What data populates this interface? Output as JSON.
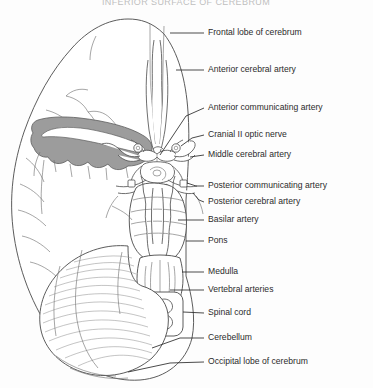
{
  "figure": {
    "title_partial": "INFERIOR SURFACE OF CEREBRUM",
    "view": "Inferior (ventral) view of the brain showing the cerebral arterial circle",
    "background_color": "#fdfdfd",
    "line_color": "#4a4a4a",
    "text_color": "#2b2b2b",
    "shaded_region_color": "#9c9c9c"
  },
  "labels": [
    {
      "id": "frontal-lobe",
      "text": "Frontal lobe of cerebrum",
      "text_x": 208,
      "text_y": 33,
      "leader_x1": 170,
      "leader_y1": 33,
      "leader_x2": 204,
      "leader_y2": 33
    },
    {
      "id": "anterior-cerebral-artery",
      "text": "Anterior cerebral artery",
      "text_x": 208,
      "text_y": 70,
      "leader_x1": 176,
      "leader_y1": 70,
      "leader_x2": 204,
      "leader_y2": 70
    },
    {
      "id": "anterior-communicating",
      "text": "Anterior communicating artery",
      "text_x": 208,
      "text_y": 108,
      "leader_x1": 160,
      "leader_y1": 155,
      "leader_x2": 204,
      "leader_y2": 108
    },
    {
      "id": "cranial-ii-optic-nerve",
      "text": "Cranial II optic nerve",
      "text_x": 208,
      "text_y": 135,
      "leader_x1": 176,
      "leader_y1": 150,
      "leader_x2": 204,
      "leader_y2": 135
    },
    {
      "id": "middle-cerebral-artery",
      "text": "Middle cerebral artery",
      "text_x": 208,
      "text_y": 155,
      "leader_x1": 186,
      "leader_y1": 158,
      "leader_x2": 204,
      "leader_y2": 155
    },
    {
      "id": "posterior-communicating",
      "text": "Posterior communicating artery",
      "text_x": 208,
      "text_y": 186,
      "leader_x1": 178,
      "leader_y1": 178,
      "leader_x2": 204,
      "leader_y2": 186
    },
    {
      "id": "posterior-cerebral-artery",
      "text": "Posterior cerebral artery",
      "text_x": 208,
      "text_y": 202,
      "leader_x1": 176,
      "leader_y1": 196,
      "leader_x2": 204,
      "leader_y2": 202
    },
    {
      "id": "basilar-artery",
      "text": "Basilar artery",
      "text_x": 208,
      "text_y": 220,
      "leader_x1": 168,
      "leader_y1": 220,
      "leader_x2": 204,
      "leader_y2": 220
    },
    {
      "id": "pons",
      "text": "Pons",
      "text_x": 208,
      "text_y": 241,
      "leader_x1": 168,
      "leader_y1": 241,
      "leader_x2": 204,
      "leader_y2": 241
    },
    {
      "id": "medulla",
      "text": "Medulla",
      "text_x": 208,
      "text_y": 272,
      "leader_x1": 172,
      "leader_y1": 272,
      "leader_x2": 204,
      "leader_y2": 272
    },
    {
      "id": "vertebral-arteries",
      "text": "Vertebral arteries",
      "text_x": 208,
      "text_y": 290,
      "leader_x1": 158,
      "leader_y1": 290,
      "leader_x2": 204,
      "leader_y2": 290
    },
    {
      "id": "spinal-cord",
      "text": "Spinal cord",
      "text_x": 208,
      "text_y": 313,
      "leader_x1": 156,
      "leader_y1": 305,
      "leader_x2": 204,
      "leader_y2": 313
    },
    {
      "id": "cerebellum",
      "text": "Cerebellum",
      "text_x": 208,
      "text_y": 338,
      "leader_x1": 120,
      "leader_y1": 330,
      "leader_x2": 204,
      "leader_y2": 338
    },
    {
      "id": "occipital-lobe",
      "text": "Occipital lobe of cerebrum",
      "text_x": 208,
      "text_y": 362,
      "leader_x1": 110,
      "leader_y1": 358,
      "leader_x2": 204,
      "leader_y2": 362
    }
  ]
}
